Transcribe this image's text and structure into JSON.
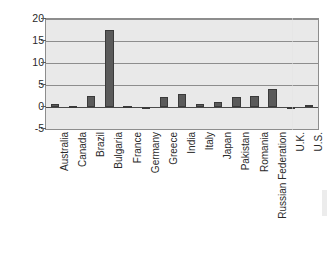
{
  "chart_data": {
    "type": "bar",
    "title": "",
    "subtitle": "",
    "xlabel": "",
    "ylabel": "Percent of GDP",
    "ylim": [
      -5,
      20
    ],
    "yticks": [
      20,
      15,
      10,
      5,
      0,
      -5
    ],
    "ytick_labels": [
      "20",
      "15",
      "10",
      "5",
      "0",
      "-5"
    ],
    "grid": true,
    "legend": null,
    "orientation": "vertical",
    "bar_color": "#5a5a5a",
    "plot_background": "#e9e9e9",
    "categories": [
      "Australia",
      "Canada",
      "Brazil",
      "Bulgaria",
      "France",
      "Germany",
      "Greece",
      "India",
      "Italy",
      "Japan",
      "Pakistan",
      "Romania",
      "Russian Federation",
      "U.K.",
      "U.S."
    ],
    "values": [
      0.7,
      0.3,
      2.4,
      17.5,
      0.2,
      0.0,
      2.2,
      3.0,
      0.7,
      1.2,
      2.3,
      2.5,
      4.0,
      -0.2,
      0.5
    ],
    "annotations": []
  },
  "figure": {
    "y_axis_title": "Percent of GDP"
  }
}
